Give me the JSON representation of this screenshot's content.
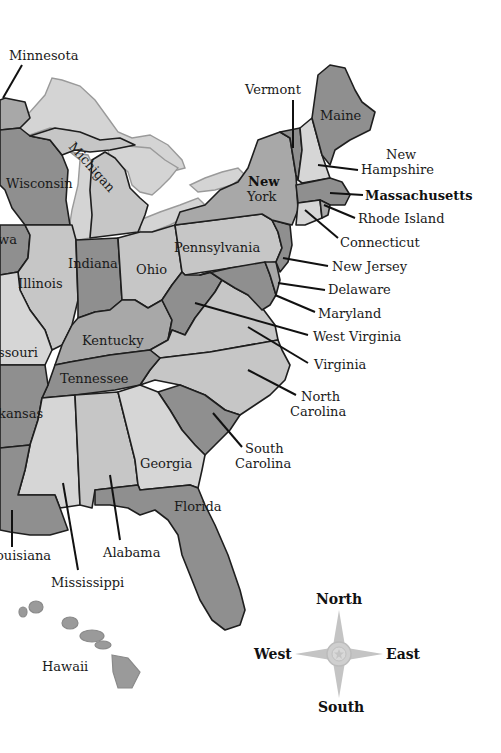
{
  "map": {
    "title": "Eastern United States",
    "colors": {
      "dark": "#8f8f8f",
      "medium": "#a8a8a8",
      "light": "#c6c6c6",
      "lighter": "#d6d6d6",
      "lake": "#d4d4d4",
      "water": "#ffffff",
      "border": "#1e1e1e"
    },
    "states": {
      "minnesota": "Minnesota",
      "wisconsin": "Wisconsin",
      "michigan": "Michigan",
      "iowa": "wa",
      "illinois": "Illinois",
      "indiana": "Indiana",
      "ohio": "Ohio",
      "missouri": "ssouri",
      "kentucky": "Kentucky",
      "tennessee": "Tennessee",
      "arkansas": "kansas",
      "louisiana": "ouisiana",
      "mississippi": "Mississippi",
      "alabama": "Alabama",
      "georgia": "Georgia",
      "florida": "Florida",
      "south_carolina_1": "South",
      "south_carolina_2": "Carolina",
      "north_carolina_1": "North",
      "north_carolina_2": "Carolina",
      "virginia": "Virginia",
      "west_virginia": "West Virginia",
      "maryland": "Maryland",
      "delaware": "Delaware",
      "new_jersey": "New Jersey",
      "pennsylvania": "Pennsylvania",
      "new_york_1": "New",
      "new_york_2": "York",
      "connecticut": "Connecticut",
      "rhode_island": "Rhode Island",
      "massachusetts": "Massachusetts",
      "new_hampshire_1": "New",
      "new_hampshire_2": "Hampshire",
      "vermont": "Vermont",
      "maine": "Maine",
      "hawaii": "Hawaii"
    },
    "compass": {
      "north": "North",
      "south": "South",
      "east": "East",
      "west": "West",
      "icon": "compass-rose-icon"
    }
  }
}
